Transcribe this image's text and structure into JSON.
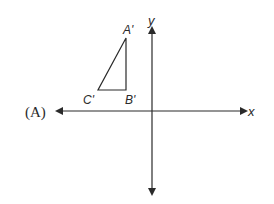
{
  "option_label": "(A)",
  "axes": {
    "x_label": "x",
    "y_label": "y"
  },
  "triangle": {
    "vertices": [
      {
        "name": "A'",
        "x": 126,
        "y": 38
      },
      {
        "name": "B'",
        "x": 126,
        "y": 90
      },
      {
        "name": "C'",
        "x": 98,
        "y": 90
      }
    ]
  },
  "colors": {
    "line": "#2a2a2a",
    "background": "#ffffff"
  }
}
